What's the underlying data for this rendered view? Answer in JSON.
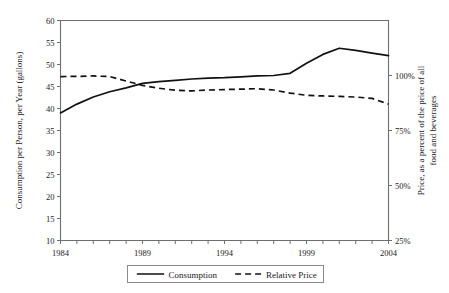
{
  "chart_data": {
    "type": "line",
    "title": "",
    "xlabel": "",
    "ylabel": "Consumption per Person, per Year (gallons)",
    "y2label": "Price, as a percent of the price of all food and beverages",
    "x": [
      1984,
      1985,
      1986,
      1987,
      1988,
      1989,
      1990,
      1991,
      1992,
      1993,
      1994,
      1995,
      1996,
      1997,
      1998,
      1999,
      2000,
      2001,
      2002,
      2003,
      2004
    ],
    "xticklabels": [
      "1984",
      "1989",
      "1994",
      "1999",
      "2004"
    ],
    "xtickvalues": [
      1984,
      1989,
      1994,
      1999,
      2004
    ],
    "xlim": [
      1984,
      2004
    ],
    "ylim": [
      10,
      60
    ],
    "yticklabels": [
      "10",
      "15",
      "20",
      "25",
      "30",
      "35",
      "40",
      "45",
      "50",
      "55",
      "60"
    ],
    "ytickvalues": [
      10,
      15,
      20,
      25,
      30,
      35,
      40,
      45,
      50,
      55,
      60
    ],
    "y2lim": [
      25,
      125
    ],
    "y2ticklabels": [
      "25%",
      "50%",
      "75%",
      "100%"
    ],
    "y2tickvalues": [
      25,
      50,
      75,
      100
    ],
    "grid": false,
    "legend_position": "below-center",
    "series": [
      {
        "name": "Consumption",
        "axis": "left",
        "style": "solid",
        "color": "#111111",
        "values": [
          39.0,
          41.0,
          42.6,
          43.8,
          44.7,
          45.7,
          46.1,
          46.4,
          46.7,
          46.9,
          47.0,
          47.2,
          47.4,
          47.5,
          48.0,
          50.3,
          52.3,
          53.7,
          53.2,
          52.6,
          52.0
        ]
      },
      {
        "name": "Relative Price",
        "axis": "right",
        "style": "dashed",
        "color": "#111111",
        "values": [
          99.5,
          99.6,
          99.8,
          99.5,
          97.5,
          95.5,
          94.2,
          93.3,
          93.0,
          93.4,
          93.6,
          93.8,
          94.0,
          93.4,
          92.0,
          91.0,
          90.7,
          90.5,
          90.2,
          89.6,
          87.0
        ]
      }
    ],
    "legend": [
      {
        "label": "Consumption",
        "style": "solid"
      },
      {
        "label": "Relative Price",
        "style": "dashed"
      }
    ]
  }
}
